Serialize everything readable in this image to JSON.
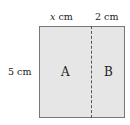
{
  "diagram": {
    "top_label_left": {
      "var": "x",
      "unit": "cm"
    },
    "top_label_right": "2 cm",
    "side_label": "5 cm",
    "region_a": "A",
    "region_b": "B",
    "fill_color": "#e6e6e6",
    "border_color": "#777777"
  }
}
